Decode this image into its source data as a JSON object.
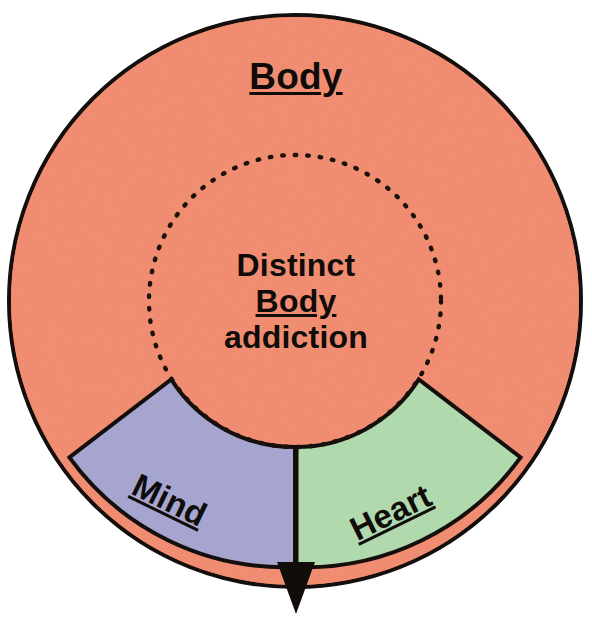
{
  "diagram": {
    "type": "concentric-circle-sector-diagram",
    "title": "Body",
    "center_label": {
      "line1": "Distinct",
      "line2": "Body",
      "line3": "addiction"
    },
    "sectors": [
      {
        "id": "mind",
        "label": "Mind",
        "fill": "#a5a5cf",
        "underlined": true
      },
      {
        "id": "heart",
        "label": "Heart",
        "fill": "#b0d9ae",
        "underlined": true
      }
    ],
    "outer_circle": {
      "label": "Body",
      "fill": "#f4896a",
      "stroke": "#140f0c",
      "center": {
        "x": 295,
        "y": 301
      },
      "radius": 288
    },
    "inner_circle": {
      "style": "dotted",
      "stroke": "#1a1208",
      "radius": 146
    },
    "arrow": {
      "name": "down-arrow",
      "direction": "down",
      "tip": {
        "x": 297,
        "y": 614
      },
      "color": "#120d0a"
    },
    "colors": {
      "body_orange": "#f4896a",
      "mind_purple": "#a5a5cf",
      "heart_green": "#b0d9ae",
      "outline_black": "#140f0c",
      "background_white": "#ffffff"
    }
  }
}
